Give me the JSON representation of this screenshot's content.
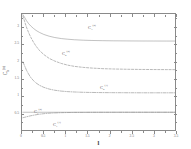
{
  "chart_data": {
    "type": "line",
    "title": "",
    "xlabel": "l",
    "ylabel": "C_k^{(n)}",
    "xlim": [
      0,
      3.5
    ],
    "ylim": [
      0.0,
      3.4
    ],
    "grid": false,
    "legend_position": "inline-annotations",
    "x_ticks": [
      {
        "value": 0,
        "label": "0"
      },
      {
        "value": 0.5,
        "label": "0.5"
      },
      {
        "value": 1,
        "label": "1"
      },
      {
        "value": 1.5,
        "label": "1.5"
      },
      {
        "value": 2,
        "label": "2"
      },
      {
        "value": 2.5,
        "label": "2.5"
      },
      {
        "value": 3,
        "label": "3"
      },
      {
        "value": 3.5,
        "label": "3.5"
      }
    ],
    "y_ticks": [
      {
        "value": 0.5,
        "label": "0.5"
      },
      {
        "value": 1.0,
        "label": "1"
      },
      {
        "value": 1.5,
        "label": "1.5"
      },
      {
        "value": 2.0,
        "label": "2"
      },
      {
        "value": 2.5,
        "label": "2.5"
      },
      {
        "value": 3.0,
        "label": "3"
      }
    ],
    "series": [
      {
        "name": "C_3^{(2)}",
        "style": "solid",
        "color": "#8d8d8d",
        "annotation": "C",
        "annotation_sub": "3",
        "annotation_sup": "(2)",
        "x": [
          0.02,
          0.06,
          0.1,
          0.15,
          0.2,
          0.26,
          0.32,
          0.4,
          0.5,
          0.62,
          0.75,
          0.9,
          1.05,
          1.2,
          1.4,
          1.6,
          1.85,
          2.1,
          2.4,
          2.7,
          3.0,
          3.3,
          3.5
        ],
        "y": [
          3.38,
          3.3,
          3.21,
          3.12,
          3.05,
          2.98,
          2.92,
          2.86,
          2.8,
          2.75,
          2.71,
          2.68,
          2.66,
          2.645,
          2.632,
          2.624,
          2.618,
          2.614,
          2.611,
          2.609,
          2.608,
          2.607,
          2.607
        ]
      },
      {
        "name": "C_2^{(2)}",
        "style": "dashed",
        "color": "#7d7d7d",
        "annotation": "C",
        "annotation_sub": "2",
        "annotation_sup": "(2)",
        "x": [
          0.02,
          0.06,
          0.1,
          0.15,
          0.2,
          0.26,
          0.32,
          0.4,
          0.5,
          0.62,
          0.75,
          0.9,
          1.05,
          1.2,
          1.4,
          1.6,
          1.85,
          2.1,
          2.4,
          2.7,
          3.0,
          3.3,
          3.5
        ],
        "y": [
          3.34,
          3.18,
          3.02,
          2.86,
          2.72,
          2.58,
          2.46,
          2.33,
          2.21,
          2.1,
          2.02,
          1.95,
          1.9,
          1.865,
          1.835,
          1.815,
          1.798,
          1.788,
          1.78,
          1.775,
          1.772,
          1.77,
          1.769
        ]
      },
      {
        "name": "C_2^{(1)}",
        "style": "dashdot",
        "color": "#7d7d7d",
        "annotation": "C",
        "annotation_sub": "2",
        "annotation_sup": "(1)",
        "x": [
          0.02,
          0.06,
          0.1,
          0.15,
          0.2,
          0.26,
          0.32,
          0.4,
          0.5,
          0.62,
          0.75,
          0.9,
          1.05,
          1.2,
          1.4,
          1.6,
          1.85,
          2.1,
          2.4,
          2.7,
          3.0,
          3.3,
          3.5
        ],
        "y": [
          2.0,
          1.88,
          1.76,
          1.64,
          1.54,
          1.45,
          1.38,
          1.31,
          1.25,
          1.2,
          1.165,
          1.14,
          1.124,
          1.114,
          1.105,
          1.1,
          1.096,
          1.094,
          1.092,
          1.091,
          1.09,
          1.09,
          1.09
        ]
      },
      {
        "name": "C_1^{(1)}",
        "style": "dashdot",
        "color": "#7d7d7d",
        "annotation": "C",
        "annotation_sub": "1",
        "annotation_sup": "(1)",
        "x": [
          0.02,
          0.06,
          0.1,
          0.15,
          0.2,
          0.26,
          0.32,
          0.4,
          0.5,
          0.62,
          0.75,
          0.9,
          1.05,
          1.2,
          1.4,
          1.6,
          1.85,
          2.1,
          2.4,
          2.7,
          3.0,
          3.3,
          3.5
        ],
        "y": [
          0.36,
          0.372,
          0.386,
          0.402,
          0.417,
          0.433,
          0.447,
          0.463,
          0.479,
          0.492,
          0.501,
          0.508,
          0.512,
          0.515,
          0.517,
          0.518,
          0.519,
          0.5195,
          0.52,
          0.52,
          0.52,
          0.52,
          0.52
        ]
      },
      {
        "name": "C_1^{(2)}",
        "style": "solid",
        "color": "#8d8d8d",
        "annotation": "C",
        "annotation_sub": "1",
        "annotation_sup": "(2)",
        "x": [
          0.02,
          0.2,
          0.5,
          0.9,
          1.3,
          1.8,
          2.3,
          2.8,
          3.3,
          3.5
        ],
        "y": [
          0.52,
          0.52,
          0.52,
          0.52,
          0.52,
          0.52,
          0.52,
          0.52,
          0.52,
          0.52
        ]
      }
    ],
    "annotations": [
      {
        "id": "annot-c3-2",
        "base": "C",
        "sub": "3",
        "sup": "(2)",
        "x_px": 88,
        "y_px": 24
      },
      {
        "id": "annot-c2-2",
        "base": "C",
        "sub": "2",
        "sup": "(2)",
        "x_px": 62,
        "y_px": 50
      },
      {
        "id": "annot-c2-1",
        "base": "C",
        "sub": "2",
        "sup": "(1)",
        "x_px": 100,
        "y_px": 84
      },
      {
        "id": "annot-c1-2",
        "base": "C",
        "sub": "1",
        "sup": "(2)",
        "x_px": 34,
        "y_px": 108
      },
      {
        "id": "annot-c1-1",
        "base": "C",
        "sub": "1",
        "sup": "(1)",
        "x_px": 53,
        "y_px": 121
      }
    ],
    "axis_title_y": {
      "base": "C",
      "sub": "k",
      "sup": "(n)"
    },
    "axis_title_x": "l",
    "colors": {
      "frame": "#8a8a8a",
      "text": "#4a4a4a",
      "curve_solid": "#8d8d8d",
      "curve_dashed": "#7d7d7d",
      "background": "#ffffff"
    }
  }
}
